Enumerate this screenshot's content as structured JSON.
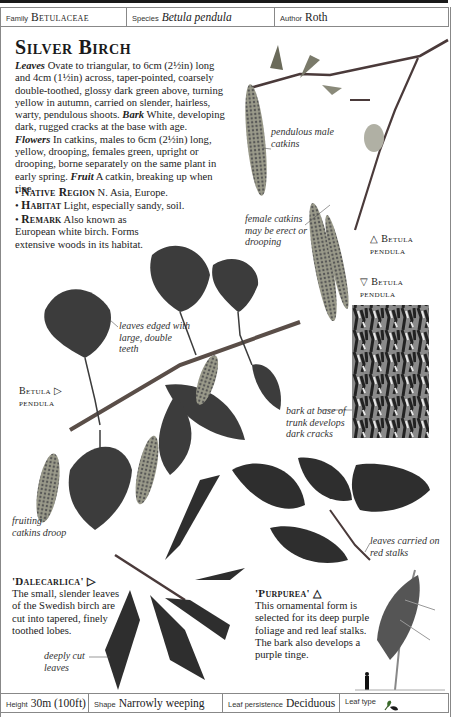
{
  "header": {
    "family_label": "Family",
    "family_value": "Betulaceae",
    "species_label": "Species",
    "species_value": "Betula pendula",
    "author_label": "Author",
    "author_value": "Roth"
  },
  "title": "Silver Birch",
  "description": {
    "leaves_heading": "Leaves",
    "leaves_text": " Ovate to triangular, to 6cm (2½in) long and 4cm (1½in) across, taper-pointed, coarsely double-toothed, glossy dark green above, turning yellow in autumn, carried on slender, hairless, warty, pendulous shoots. ",
    "bark_heading": "Bark",
    "bark_text": " White, developing dark, rugged cracks at the base with age. ",
    "flowers_heading": "Flowers",
    "flowers_text": " In catkins, males to 6cm (2½in) long, yellow, drooping, females green, upright or drooping, borne separately on the same plant in early spring. ",
    "fruit_heading": "Fruit",
    "fruit_text": " A catkin, breaking up when ripe."
  },
  "bullets": [
    {
      "heading": "Native Region",
      "text": " N. Asia, Europe."
    },
    {
      "heading": "Habitat",
      "text": " Light, especially sandy, soil."
    },
    {
      "heading": "Remark",
      "text": " Also known as European white birch. Forms extensive woods in its habitat."
    }
  ],
  "annotations": {
    "male_catkins": "pendulous male catkins",
    "female_catkins": "female catkins may be erect or drooping",
    "leaves_edged": "leaves edged with large, double teeth",
    "bark": "bark at base of trunk develops dark cracks",
    "fruiting": "fruiting catkins droop",
    "red_stalks": "leaves carried on red stalks",
    "deeply_cut": "deeply cut leaves"
  },
  "captions": {
    "shoot_top": "△ Betula pendula",
    "bark_photo": "▽ Betula pendula",
    "branch_left": "Betula ▷ pendula"
  },
  "varieties": [
    {
      "name": "'Dalecarlica' ▷",
      "text": "The small, slender leaves of the Swedish birch are cut into tapered, finely toothed lobes."
    },
    {
      "name": "'Purpurea' △",
      "text": "This ornamental form is selected for its deep purple foliage and red leaf stalks. The bark also develops a purple tinge."
    }
  ],
  "footer": {
    "height_label": "Height",
    "height_value": "30m (100ft)",
    "shape_label": "Shape",
    "shape_value": "Narrowly weeping",
    "persistence_label": "Leaf persistence",
    "persistence_value": "Deciduous",
    "leaftype_label": "Leaf type",
    "leaftype_icon": "leaf-type-icon"
  }
}
